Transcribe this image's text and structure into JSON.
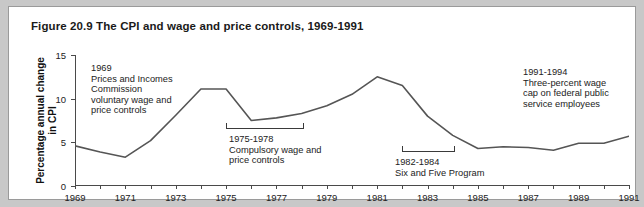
{
  "figure": {
    "title": "Figure 20.9 The CPI and wage and price controls, 1969-1991"
  },
  "chart_data": {
    "type": "line",
    "title": "Figure 20.9 The CPI and wage and price controls, 1969-1991",
    "xlabel": "",
    "ylabel": "Percentage annual change in CPI",
    "xlim": [
      1969,
      1991
    ],
    "ylim": [
      0,
      15
    ],
    "yticks": [
      0,
      5,
      10,
      15
    ],
    "xticks": [
      1969,
      1970,
      1971,
      1972,
      1973,
      1974,
      1975,
      1976,
      1977,
      1978,
      1979,
      1980,
      1981,
      1982,
      1983,
      1984,
      1985,
      1986,
      1987,
      1988,
      1989,
      1990,
      1991
    ],
    "xtick_labels": [
      "1969",
      "",
      "1971",
      "",
      "1973",
      "",
      "1975",
      "",
      "1977",
      "",
      "1979",
      "",
      "1981",
      "",
      "1983",
      "",
      "1985",
      "",
      "1987",
      "",
      "1989",
      "",
      "1991"
    ],
    "grid": false,
    "legend": false,
    "line_color": "#555555",
    "series": [
      {
        "name": "Percentage annual change in CPI",
        "x": [
          1969,
          1970,
          1971,
          1972,
          1973,
          1974,
          1975,
          1976,
          1977,
          1978,
          1979,
          1980,
          1981,
          1982,
          1983,
          1984,
          1985,
          1986,
          1987,
          1988,
          1989,
          1990,
          1991
        ],
        "values": [
          4.6,
          3.9,
          3.3,
          5.2,
          8.1,
          11.1,
          11.1,
          7.5,
          7.8,
          8.3,
          9.2,
          10.5,
          12.5,
          11.5,
          8.0,
          5.8,
          4.3,
          4.5,
          4.4,
          4.1,
          4.9,
          4.9,
          5.7
        ]
      }
    ],
    "annotations": [
      {
        "id": "prices-incomes-commission",
        "period": "1969",
        "text": "1969\nPrices and Incomes\nCommission\nvoluntary wage and\nprice controls"
      },
      {
        "id": "compulsory-wage-price-controls",
        "period": "1975-1978",
        "text": "1975-1978\nCompulsory wage and\nprice controls"
      },
      {
        "id": "six-and-five-program",
        "period": "1982-1984",
        "text": "1982-1984\nSix and Five Program"
      },
      {
        "id": "three-percent-wage-cap",
        "period": "1991-1994",
        "text": "1991-1994\nThree-percent wage\ncap on federal public\nservice employees"
      }
    ],
    "brackets": [
      {
        "id": "bracket-1975-1978",
        "from": 1975,
        "to": 1978
      },
      {
        "id": "bracket-1982-1984",
        "from": 1982,
        "to": 1984
      }
    ]
  }
}
